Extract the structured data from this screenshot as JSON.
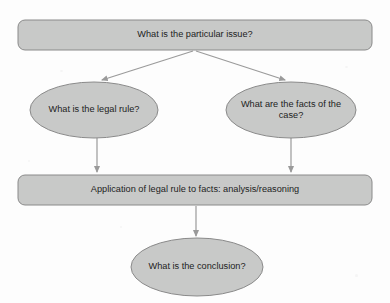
{
  "diagram": {
    "background_color": "#fdfdfd",
    "shape_fill_color": "#c8c9c8",
    "shape_stroke_color": "#8a8a8a",
    "arrow_color": "#9a9a9a",
    "text_color": "#1d1d1d",
    "nodes": [
      {
        "id": "issue",
        "shape": "rounded-rectangle",
        "label": "What is the particular issue?",
        "x": 18,
        "y": 20,
        "width": 354,
        "height": 30,
        "corner_radius": 7
      },
      {
        "id": "rule",
        "shape": "ellipse",
        "label": "What is the legal rule?",
        "cx": 94,
        "cy": 110,
        "rx": 64,
        "ry": 28
      },
      {
        "id": "facts",
        "shape": "ellipse",
        "label": "What are the facts of the case?",
        "cx": 291,
        "cy": 110,
        "rx": 65,
        "ry": 28
      },
      {
        "id": "application",
        "shape": "rounded-rectangle",
        "label": "Application of legal rule to facts: analysis/reasoning",
        "x": 18,
        "y": 175,
        "width": 354,
        "height": 30,
        "corner_radius": 7
      },
      {
        "id": "conclusion",
        "shape": "ellipse",
        "label": "What is the conclusion?",
        "cx": 197,
        "cy": 267,
        "rx": 66,
        "ry": 29
      }
    ],
    "edges": [
      {
        "id": "issue-to-rule",
        "from": "issue",
        "to": "rule",
        "style": "diagonal-arrow"
      },
      {
        "id": "issue-to-facts",
        "from": "issue",
        "to": "facts",
        "style": "diagonal-arrow"
      },
      {
        "id": "rule-to-application",
        "from": "rule",
        "to": "application",
        "style": "vertical-arrow"
      },
      {
        "id": "facts-to-application",
        "from": "facts",
        "to": "application",
        "style": "vertical-arrow"
      },
      {
        "id": "application-to-conclusion",
        "from": "application",
        "to": "conclusion",
        "style": "vertical-arrow"
      }
    ]
  }
}
